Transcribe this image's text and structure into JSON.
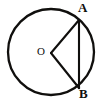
{
  "figure": {
    "kind": "circle-with-central-angle",
    "background_color": "#ffffff",
    "stroke_color": "#100f0d",
    "labels": {
      "center": "O",
      "point_top": "A",
      "point_bottom": "B"
    },
    "geometry": {
      "circle": {
        "cx": 51,
        "cy": 52,
        "r": 43
      },
      "center_point": {
        "x": 51,
        "y": 53
      },
      "point_a": {
        "x": 79,
        "y": 20
      },
      "point_b": {
        "x": 79,
        "y": 88
      },
      "segments": [
        {
          "name": "radius-OA",
          "from": "O",
          "to": "A"
        },
        {
          "name": "radius-OB",
          "from": "O",
          "to": "B"
        },
        {
          "name": "chord-AB",
          "from": "A",
          "to": "B"
        }
      ]
    }
  }
}
